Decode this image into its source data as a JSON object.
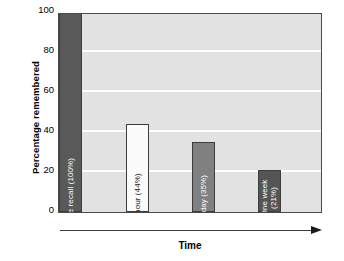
{
  "chart_data": {
    "type": "bar",
    "title": "",
    "xlabel": "Time",
    "ylabel": "Percentage remembered",
    "ylim": [
      0,
      100
    ],
    "yticks": [
      0,
      20,
      40,
      60,
      80,
      100
    ],
    "grid": true,
    "legend": false,
    "categories": [
      "Immediate recall",
      "One hour",
      "One day",
      "One week"
    ],
    "values": [
      100,
      44,
      35,
      21
    ],
    "bars": [
      {
        "label": "Immediate recall (100%)",
        "label_lines": [
          "Immediate recall (100%)"
        ],
        "value": 100,
        "value_text": "100%",
        "fill": "#595959",
        "text_color": "#ffffff"
      },
      {
        "label": "One hour (44%)",
        "label_lines": [
          "One hour (44%)"
        ],
        "value": 44,
        "value_text": "44%",
        "fill": "#fbfbfb",
        "text_color": "#1a1a1a"
      },
      {
        "label": "One day (35%)",
        "label_lines": [
          "One day (35%)"
        ],
        "value": 35,
        "value_text": "35%",
        "fill": "#808080",
        "text_color": "#ffffff"
      },
      {
        "label": "One week (21%)",
        "label_lines": [
          "One week",
          "(21%)"
        ],
        "value": 21,
        "value_text": "21%",
        "fill": "#555555",
        "text_color": "#ffffff"
      }
    ],
    "xaxis_arrow": "right-arrow",
    "plot_background": "#e2e2e2",
    "gridline_color": "#ffffff",
    "axis_color": "#4a4a4a"
  }
}
